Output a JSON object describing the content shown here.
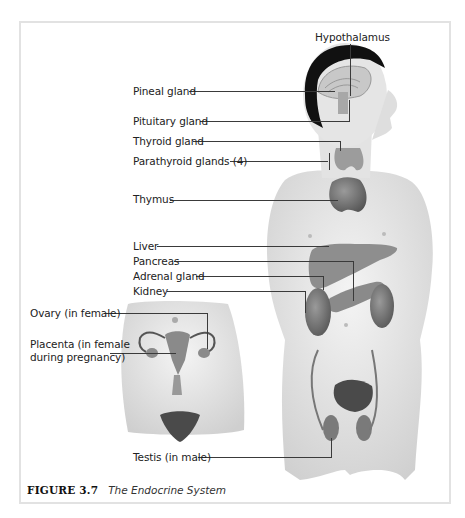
{
  "figure": {
    "number": "FIGURE 3.7",
    "title": "The Endocrine System"
  },
  "labels": {
    "hypothalamus": "Hypothalamus",
    "pineal": "Pineal gland",
    "pituitary": "Pituitary gland",
    "thyroid": "Thyroid gland",
    "parathyroid": "Parathyroid glands (4)",
    "thymus": "Thymus",
    "liver": "Liver",
    "pancreas": "Pancreas",
    "adrenal": "Adrenal gland",
    "kidney": "Kidney",
    "ovary": "Ovary (in female)",
    "placenta_1": "Placenta (in female",
    "placenta_2": "during pregnancy)",
    "testis": "Testis (in male)"
  },
  "colors": {
    "skin": "#e6e6e6",
    "organ": "#7a7a7a",
    "hair": "#111111",
    "leader_line": "#3a3a3a",
    "frame_border": "#e2e2e2"
  }
}
